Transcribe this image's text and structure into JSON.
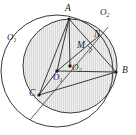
{
  "figure": {
    "type": "geometry-diagram",
    "width": 136,
    "height": 135,
    "background_color": "#ffffff",
    "stroke_color": "#3a3a3a",
    "shade_fill": "#d9d9d9",
    "hatch_color": "#ffffff",
    "label_color": "#1a1a1a"
  },
  "labels": {
    "vertex_a": "A",
    "vertex_b": "B",
    "vertex_c": "C",
    "point_m": "M",
    "point_n": "N",
    "center_o1_outer": "O",
    "center_o1_outer_sub": "1",
    "center_o2_outer": "O",
    "center_o2_outer_sub": "2",
    "center_o1_inner": "O",
    "center_o1_inner_sub": "1",
    "center_o2_inner": "O",
    "center_o2_inner_sub": "2"
  },
  "geometry": {
    "circle_o1": {
      "cx": 57,
      "cy": 71,
      "r": 56,
      "shaded": false,
      "label_position": "upper-left"
    },
    "circle_o2": {
      "cx": 70,
      "cy": 66,
      "r": 47,
      "shaded": true,
      "label_position": "upper-right"
    },
    "points": {
      "A": {
        "x": 69,
        "y": 19
      },
      "B": {
        "x": 116,
        "y": 72
      },
      "C": {
        "x": 39,
        "y": 95
      },
      "M": {
        "x": 84,
        "y": 48
      },
      "N": {
        "x": 97,
        "y": 38
      },
      "O1": {
        "x": 57,
        "y": 71
      },
      "O2": {
        "x": 70,
        "y": 66
      }
    },
    "segments": [
      {
        "name": "A-B",
        "from": "A",
        "to": "B"
      },
      {
        "name": "A-C",
        "from": "A",
        "to": "C"
      },
      {
        "name": "A-O1",
        "from": "A",
        "to": "O1"
      },
      {
        "name": "A-O2",
        "from": "A",
        "to": "O2"
      },
      {
        "name": "O1-B",
        "from": "O1",
        "to": "B"
      },
      {
        "name": "O1-C",
        "from": "O1",
        "to": "C"
      },
      {
        "name": "O1-N",
        "from": "O1",
        "to": "N"
      },
      {
        "name": "C-B",
        "from": "C",
        "to": "B"
      },
      {
        "name": "C-through-O2-extended",
        "from": "C",
        "to": "N-extended"
      }
    ],
    "right_angle_at": "M",
    "right_angle_size": 6
  }
}
